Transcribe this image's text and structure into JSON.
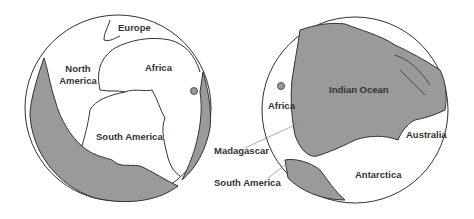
{
  "figure": {
    "left_globe": {
      "labels": {
        "europe": "Europe",
        "north_america_1": "North",
        "north_america_2": "America",
        "africa": "Africa",
        "south_america": "South America"
      }
    },
    "right_globe": {
      "labels": {
        "africa": "Africa",
        "indian_ocean": "Indian Ocean",
        "australia": "Australia",
        "antarctica": "Antarctica"
      }
    },
    "callouts": {
      "madagascar": "Madagascar",
      "south_america": "South America"
    },
    "colors": {
      "ocean": "#9a9a9a",
      "land": "#ffffff",
      "outline": "#333333"
    }
  }
}
